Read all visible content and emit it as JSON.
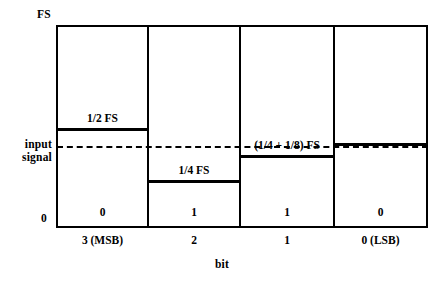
{
  "axes": {
    "y_top_label": "FS",
    "y_bottom_label": "0",
    "y_mid_label_line1": "input",
    "y_mid_label_line2": "signal",
    "x_axis_title": "bit"
  },
  "columns": [
    {
      "tick_label": "3 (MSB)",
      "bit_value": "0",
      "level_caption": "1/2 FS"
    },
    {
      "tick_label": "2",
      "bit_value": "1",
      "level_caption": "1/4 FS"
    },
    {
      "tick_label": "1",
      "bit_value": "1",
      "level_caption": "(1/4 + 1/8) FS"
    },
    {
      "tick_label": "0 (LSB)",
      "bit_value": "0",
      "level_caption": ""
    }
  ],
  "chart_data": {
    "type": "bar",
    "title": "",
    "xlabel": "bit",
    "ylabel": "",
    "categories": [
      "3 (MSB)",
      "2",
      "1",
      "0 (LSB)"
    ],
    "values": [
      0.5,
      0.25,
      0.375,
      0.4375
    ],
    "value_labels": [
      "1/2 FS",
      "1/4 FS",
      "(1/4 + 1/8) FS",
      ""
    ],
    "bit_values": [
      0,
      1,
      1,
      0
    ],
    "ylim": [
      0,
      1
    ],
    "ytick_labels": [
      "0",
      "FS"
    ],
    "ytick_values": [
      0,
      1
    ],
    "grid": false,
    "legend": "none",
    "annotations": [
      {
        "name": "input-signal-line",
        "label": "input signal",
        "type": "horizontal-dashed-line",
        "value": 0.4
      }
    ],
    "series": [
      {
        "name": "successive approximation trial level",
        "values": [
          0.5,
          0.25,
          0.375,
          0.4375
        ]
      }
    ],
    "colors": {
      "line": "#000000",
      "background": "#ffffff"
    }
  }
}
